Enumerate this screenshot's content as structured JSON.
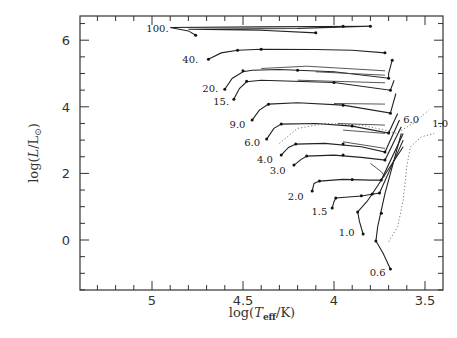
{
  "chart_data": {
    "type": "line",
    "title": "",
    "xlabel": "log(T_eff/K)",
    "ylabel": "log(L/L_sun)",
    "xlim": [
      5.4,
      3.4
    ],
    "ylim": [
      -1.5,
      6.72
    ],
    "x_inverted": true,
    "grid": false,
    "legend": "none (tracks labelled by stellar mass in solar masses)",
    "x_ticks": [
      {
        "value": 5.0,
        "label": "5"
      },
      {
        "value": 4.5,
        "label": "4.5"
      },
      {
        "value": 4.0,
        "label": "4"
      },
      {
        "value": 3.5,
        "label": "3.5"
      }
    ],
    "y_ticks": [
      {
        "value": 6,
        "label": "6"
      },
      {
        "value": 4,
        "label": "4"
      },
      {
        "value": 2,
        "label": "2"
      },
      {
        "value": 0,
        "label": "0"
      }
    ],
    "series": [
      {
        "name": "100.",
        "label_pos": [
          4.97,
          6.25
        ],
        "points": [
          [
            4.76,
            6.15
          ],
          [
            4.8,
            6.28
          ],
          [
            4.9,
            6.38
          ],
          [
            4.4,
            6.4
          ],
          [
            3.8,
            6.42
          ],
          [
            4.2,
            6.35
          ],
          [
            4.8,
            6.33
          ],
          [
            4.4,
            6.3
          ],
          [
            4.1,
            6.22
          ]
        ],
        "dots": [
          [
            4.76,
            6.15
          ],
          [
            3.8,
            6.42
          ],
          [
            4.1,
            6.22
          ],
          [
            3.95,
            6.42
          ]
        ]
      },
      {
        "name": "40.",
        "label_pos": [
          4.79,
          5.33
        ],
        "points": [
          [
            4.69,
            5.43
          ],
          [
            4.62,
            5.62
          ],
          [
            4.53,
            5.7
          ],
          [
            4.4,
            5.73
          ],
          [
            4.1,
            5.72
          ],
          [
            3.9,
            5.7
          ],
          [
            3.72,
            5.62
          ]
        ],
        "dots": [
          [
            4.69,
            5.43
          ],
          [
            4.53,
            5.7
          ],
          [
            4.4,
            5.73
          ],
          [
            3.72,
            5.62
          ]
        ]
      },
      {
        "name": "20.",
        "label_pos": [
          4.68,
          4.43
        ],
        "points": [
          [
            4.6,
            4.53
          ],
          [
            4.56,
            4.85
          ],
          [
            4.5,
            5.05
          ],
          [
            4.45,
            5.1
          ],
          [
            4.3,
            5.12
          ],
          [
            4.0,
            5.05
          ],
          [
            3.7,
            4.86
          ],
          [
            3.7,
            5.0
          ],
          [
            3.68,
            5.4
          ]
        ],
        "dots": [
          [
            4.6,
            4.53
          ],
          [
            4.5,
            5.08
          ],
          [
            4.2,
            5.1
          ],
          [
            3.7,
            4.86
          ],
          [
            3.68,
            5.4
          ]
        ],
        "loops": [
          [
            [
              4.4,
              5.15
            ],
            [
              4.15,
              5.22
            ],
            [
              3.72,
              5.08
            ]
          ],
          [
            [
              4.1,
              5.05
            ],
            [
              3.72,
              4.95
            ]
          ]
        ]
      },
      {
        "name": "15.",
        "label_pos": [
          4.62,
          4.05
        ],
        "points": [
          [
            4.55,
            4.23
          ],
          [
            4.52,
            4.55
          ],
          [
            4.48,
            4.75
          ],
          [
            4.4,
            4.8
          ],
          [
            4.0,
            4.73
          ],
          [
            3.69,
            4.5
          ],
          [
            3.67,
            4.8
          ]
        ],
        "dots": [
          [
            4.55,
            4.23
          ],
          [
            4.48,
            4.77
          ],
          [
            4.0,
            4.73
          ],
          [
            3.69,
            4.5
          ]
        ],
        "loops": [
          [
            [
              4.2,
              4.8
            ],
            [
              3.72,
              4.72
            ]
          ]
        ]
      },
      {
        "name": "9.0",
        "label_pos": [
          4.53,
          3.35
        ],
        "points": [
          [
            4.45,
            3.6
          ],
          [
            4.41,
            3.9
          ],
          [
            4.36,
            4.08
          ],
          [
            4.2,
            4.12
          ],
          [
            3.95,
            4.05
          ],
          [
            3.69,
            3.81
          ],
          [
            3.66,
            4.4
          ]
        ],
        "dots": [
          [
            4.45,
            3.6
          ],
          [
            4.36,
            4.08
          ],
          [
            3.95,
            4.05
          ],
          [
            3.69,
            3.81
          ]
        ],
        "loops": [
          [
            [
              4.0,
              4.1
            ],
            [
              3.72,
              4.08
            ]
          ]
        ]
      },
      {
        "name": "6.0",
        "label_pos": [
          4.45,
          2.83
        ],
        "points": [
          [
            4.37,
            3.03
          ],
          [
            4.33,
            3.35
          ],
          [
            4.29,
            3.48
          ],
          [
            4.1,
            3.5
          ],
          [
            3.9,
            3.42
          ],
          [
            3.7,
            3.21
          ],
          [
            3.65,
            3.8
          ]
        ],
        "dots": [
          [
            4.37,
            3.03
          ],
          [
            4.29,
            3.48
          ],
          [
            3.9,
            3.42
          ],
          [
            3.7,
            3.21
          ]
        ],
        "loops": [
          [
            [
              3.98,
              3.5
            ],
            [
              3.72,
              3.45
            ]
          ],
          [
            [
              3.95,
              3.3
            ],
            [
              3.72,
              3.2
            ]
          ]
        ]
      },
      {
        "name": "4.0",
        "label_pos": [
          4.38,
          2.32
        ],
        "points": [
          [
            4.29,
            2.55
          ],
          [
            4.25,
            2.78
          ],
          [
            4.21,
            2.88
          ],
          [
            4.05,
            2.9
          ],
          [
            3.85,
            2.8
          ],
          [
            3.72,
            2.64
          ],
          [
            3.64,
            3.6
          ]
        ],
        "dots": [
          [
            4.29,
            2.55
          ],
          [
            4.21,
            2.88
          ],
          [
            3.95,
            2.88
          ],
          [
            3.72,
            2.64
          ]
        ],
        "loops": [
          [
            [
              3.95,
              2.95
            ],
            [
              3.72,
              2.75
            ]
          ]
        ]
      },
      {
        "name": "3.0",
        "label_pos": [
          4.31,
          1.98
        ],
        "points": [
          [
            4.22,
            2.25
          ],
          [
            4.18,
            2.42
          ],
          [
            4.15,
            2.52
          ],
          [
            4.0,
            2.55
          ],
          [
            3.85,
            2.48
          ],
          [
            3.72,
            2.4
          ],
          [
            3.63,
            3.4
          ]
        ],
        "dots": [
          [
            4.22,
            2.25
          ],
          [
            4.15,
            2.52
          ],
          [
            3.95,
            2.55
          ],
          [
            3.72,
            2.4
          ]
        ],
        "loops": [
          [
            [
              3.8,
              2.3
            ],
            [
              3.74,
              2.05
            ],
            [
              3.72,
              1.9
            ]
          ]
        ]
      },
      {
        "name": "2.0",
        "label_pos": [
          4.21,
          1.2
        ],
        "points": [
          [
            4.12,
            1.47
          ],
          [
            4.11,
            1.7
          ],
          [
            4.08,
            1.77
          ],
          [
            3.95,
            1.82
          ],
          [
            3.8,
            1.8
          ],
          [
            3.74,
            1.8
          ],
          [
            3.62,
            3.2
          ]
        ],
        "dots": [
          [
            4.12,
            1.47
          ],
          [
            4.08,
            1.77
          ],
          [
            3.9,
            1.82
          ],
          [
            3.74,
            1.8
          ]
        ]
      },
      {
        "name": "1.5",
        "label_pos": [
          4.08,
          0.75
        ],
        "points": [
          [
            4.01,
            0.96
          ],
          [
            4.0,
            1.15
          ],
          [
            3.99,
            1.26
          ],
          [
            3.85,
            1.32
          ],
          [
            3.75,
            1.41
          ],
          [
            3.62,
            3.0
          ]
        ],
        "dots": [
          [
            4.01,
            0.96
          ],
          [
            3.99,
            1.26
          ],
          [
            3.85,
            1.33
          ],
          [
            3.75,
            1.41
          ]
        ]
      },
      {
        "name": "1.0",
        "label_pos": [
          3.93,
          0.12
        ],
        "points": [
          [
            3.84,
            0.18
          ],
          [
            3.86,
            0.55
          ],
          [
            3.87,
            0.84
          ],
          [
            3.82,
            1.15
          ],
          [
            3.79,
            1.38
          ],
          [
            3.62,
            2.8
          ]
        ],
        "dots": [
          [
            3.84,
            0.18
          ],
          [
            3.87,
            0.84
          ],
          [
            3.79,
            1.38
          ]
        ]
      },
      {
        "name": "0.6",
        "label_pos": [
          3.76,
          -1.08
        ],
        "points": [
          [
            3.69,
            -0.87
          ],
          [
            3.73,
            -0.4
          ],
          [
            3.77,
            -0.03
          ],
          [
            3.76,
            0.4
          ],
          [
            3.72,
            1.4
          ],
          [
            3.63,
            3.2
          ]
        ],
        "dots": [
          [
            3.69,
            -0.87
          ],
          [
            3.77,
            -0.03
          ],
          [
            3.74,
            0.8
          ]
        ]
      }
    ],
    "dotted_lines": [
      {
        "name": "6.0",
        "label_pos": [
          3.62,
          3.5
        ],
        "points": [
          [
            4.3,
            2.9
          ],
          [
            4.2,
            3.35
          ],
          [
            4.05,
            3.5
          ],
          [
            3.85,
            3.45
          ],
          [
            3.72,
            3.3
          ],
          [
            3.66,
            3.2
          ],
          [
            3.55,
            3.55
          ],
          [
            3.48,
            3.9
          ]
        ]
      },
      {
        "name": "1.0",
        "label_pos": [
          3.46,
          3.4
        ],
        "points": [
          [
            3.7,
            -0.05
          ],
          [
            3.65,
            0.4
          ],
          [
            3.62,
            1.2
          ],
          [
            3.6,
            2.2
          ],
          [
            3.58,
            2.8
          ],
          [
            3.52,
            3.1
          ],
          [
            3.45,
            3.2
          ]
        ]
      }
    ]
  }
}
